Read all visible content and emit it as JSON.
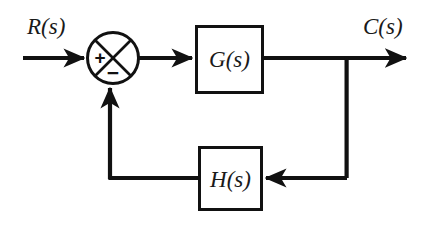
{
  "diagram": {
    "type": "control-system-block-diagram",
    "background_color": "#ffffff",
    "line_color": "#111111",
    "text_color": "#1a1a1a",
    "signals": {
      "input_label": "R(s)",
      "output_label": "C(s)"
    },
    "blocks": [
      {
        "id": "plant",
        "label": "G(s)"
      },
      {
        "id": "feedback",
        "label": "H(s)"
      }
    ],
    "summing_junction": {
      "name": "summing-junction",
      "style": "circle-with-diagonal-cross",
      "signs": {
        "input_sign": "+",
        "feedback_sign": "−"
      }
    },
    "connections": [
      {
        "from": "R(s)",
        "to": "summing-junction",
        "arrow": true
      },
      {
        "from": "summing-junction",
        "to": "G(s)",
        "arrow": true
      },
      {
        "from": "G(s)",
        "to": "C(s)",
        "arrow": true
      },
      {
        "from": "C(s) takeoff",
        "to": "H(s)",
        "arrow": true
      },
      {
        "from": "H(s)",
        "to": "summing-junction",
        "arrow": true
      }
    ]
  }
}
